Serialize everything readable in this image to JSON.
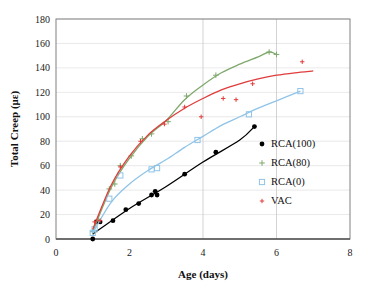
{
  "chart_data": {
    "type": "scatter",
    "title": "",
    "xlabel": "Age (days)",
    "ylabel": "Total Creep (με)",
    "xlim": [
      0,
      8
    ],
    "ylim": [
      0,
      180
    ],
    "xticks": [
      0,
      2,
      4,
      6,
      8
    ],
    "yticks": [
      0,
      20,
      40,
      60,
      80,
      100,
      120,
      140,
      160,
      180
    ],
    "grid": "horizontal gridlines at every y tick; vertical gridlines at x = 4 and x = 6",
    "legend_position": "inside plot, right side, middle",
    "series": [
      {
        "name": "RCA(100)",
        "color": "#000000",
        "marker": "filled-circle",
        "line": "solid",
        "points": [
          {
            "x": 1.0,
            "y": 0
          },
          {
            "x": 1.1,
            "y": 14
          },
          {
            "x": 1.2,
            "y": 14
          },
          {
            "x": 1.55,
            "y": 15
          },
          {
            "x": 1.9,
            "y": 24
          },
          {
            "x": 2.25,
            "y": 29
          },
          {
            "x": 2.6,
            "y": 36
          },
          {
            "x": 2.7,
            "y": 39
          },
          {
            "x": 2.75,
            "y": 36
          },
          {
            "x": 3.5,
            "y": 53
          },
          {
            "x": 4.35,
            "y": 71
          },
          {
            "x": 5.4,
            "y": 92
          }
        ],
        "trend": [
          {
            "x": 1.0,
            "y": 4
          },
          {
            "x": 2.0,
            "y": 25
          },
          {
            "x": 3.0,
            "y": 43
          },
          {
            "x": 4.0,
            "y": 63
          },
          {
            "x": 5.0,
            "y": 81
          },
          {
            "x": 5.4,
            "y": 92
          }
        ]
      },
      {
        "name": "RCA(80)",
        "color": "#7fa86b",
        "marker": "plus",
        "line": "solid",
        "points": [
          {
            "x": 1.0,
            "y": 6
          },
          {
            "x": 1.15,
            "y": 16
          },
          {
            "x": 1.45,
            "y": 41
          },
          {
            "x": 1.6,
            "y": 45
          },
          {
            "x": 1.75,
            "y": 60
          },
          {
            "x": 2.05,
            "y": 68
          },
          {
            "x": 2.35,
            "y": 82
          },
          {
            "x": 2.6,
            "y": 86
          },
          {
            "x": 3.05,
            "y": 96
          },
          {
            "x": 3.55,
            "y": 117
          },
          {
            "x": 4.35,
            "y": 134
          },
          {
            "x": 5.8,
            "y": 153
          },
          {
            "x": 6.0,
            "y": 151
          }
        ],
        "trend": [
          {
            "x": 1.0,
            "y": 6
          },
          {
            "x": 1.5,
            "y": 42
          },
          {
            "x": 2.0,
            "y": 66
          },
          {
            "x": 2.5,
            "y": 84
          },
          {
            "x": 3.0,
            "y": 97
          },
          {
            "x": 3.5,
            "y": 114
          },
          {
            "x": 4.0,
            "y": 126
          },
          {
            "x": 4.5,
            "y": 136
          },
          {
            "x": 5.0,
            "y": 143
          },
          {
            "x": 5.5,
            "y": 149
          },
          {
            "x": 5.8,
            "y": 153
          },
          {
            "x": 6.0,
            "y": 151
          }
        ]
      },
      {
        "name": "RCA(0)",
        "color": "#8fc4e8",
        "marker": "open-square",
        "line": "solid",
        "points": [
          {
            "x": 1.0,
            "y": 5
          },
          {
            "x": 1.05,
            "y": 8
          },
          {
            "x": 1.45,
            "y": 33
          },
          {
            "x": 1.75,
            "y": 52
          },
          {
            "x": 2.6,
            "y": 57
          },
          {
            "x": 2.75,
            "y": 58
          },
          {
            "x": 3.85,
            "y": 81
          },
          {
            "x": 5.25,
            "y": 102
          },
          {
            "x": 6.65,
            "y": 121
          }
        ],
        "trend": [
          {
            "x": 1.0,
            "y": 5
          },
          {
            "x": 1.5,
            "y": 30
          },
          {
            "x": 2.0,
            "y": 45
          },
          {
            "x": 2.5,
            "y": 56
          },
          {
            "x": 3.0,
            "y": 65
          },
          {
            "x": 3.5,
            "y": 75
          },
          {
            "x": 4.0,
            "y": 84
          },
          {
            "x": 4.5,
            "y": 93
          },
          {
            "x": 5.0,
            "y": 100
          },
          {
            "x": 5.5,
            "y": 107
          },
          {
            "x": 6.0,
            "y": 113
          },
          {
            "x": 6.65,
            "y": 121
          }
        ]
      },
      {
        "name": "VAC",
        "color": "#e03c3c",
        "marker": "small-plus",
        "line": "solid",
        "points": [
          {
            "x": 1.05,
            "y": 14
          },
          {
            "x": 1.2,
            "y": 15
          },
          {
            "x": 1.75,
            "y": 59
          },
          {
            "x": 2.3,
            "y": 80
          },
          {
            "x": 2.95,
            "y": 94
          },
          {
            "x": 3.5,
            "y": 108
          },
          {
            "x": 3.95,
            "y": 100
          },
          {
            "x": 4.55,
            "y": 115
          },
          {
            "x": 4.9,
            "y": 114
          },
          {
            "x": 5.35,
            "y": 127
          },
          {
            "x": 6.7,
            "y": 145
          }
        ],
        "trend": [
          {
            "x": 1.0,
            "y": 8
          },
          {
            "x": 1.5,
            "y": 44
          },
          {
            "x": 2.0,
            "y": 68
          },
          {
            "x": 2.5,
            "y": 85
          },
          {
            "x": 3.0,
            "y": 97
          },
          {
            "x": 3.5,
            "y": 107
          },
          {
            "x": 4.0,
            "y": 115
          },
          {
            "x": 4.5,
            "y": 122
          },
          {
            "x": 5.0,
            "y": 127
          },
          {
            "x": 5.5,
            "y": 131
          },
          {
            "x": 6.0,
            "y": 134
          },
          {
            "x": 6.5,
            "y": 136
          },
          {
            "x": 7.0,
            "y": 137.5
          }
        ]
      }
    ]
  },
  "axes": {
    "x_title": "Age (days)",
    "y_title": "Total Creep (με)",
    "x_tick_labels": [
      "0",
      "2",
      "4",
      "6",
      "8"
    ],
    "y_tick_labels": [
      "0",
      "20",
      "40",
      "60",
      "80",
      "100",
      "120",
      "140",
      "160",
      "180"
    ]
  },
  "legend": {
    "items": [
      {
        "label": "RCA(100)",
        "color": "#000000",
        "marker": "filled-circle"
      },
      {
        "label": "RCA(80)",
        "color": "#7fa86b",
        "marker": "plus"
      },
      {
        "label": "RCA(0)",
        "color": "#8fc4e8",
        "marker": "open-square"
      },
      {
        "label": "VAC",
        "color": "#e03c3c",
        "marker": "small-plus"
      }
    ]
  }
}
